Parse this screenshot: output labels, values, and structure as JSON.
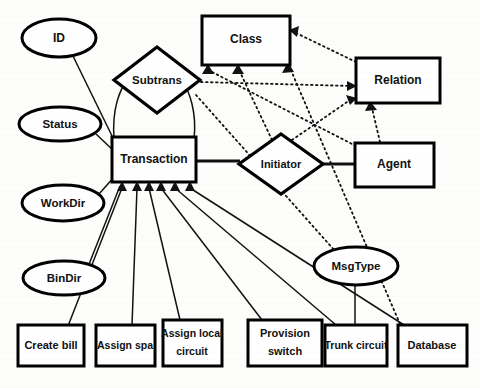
{
  "diagram": {
    "type": "entity-relationship",
    "stroke_color": "#111111",
    "fill_color": "#ffffff",
    "background_color": "#fdfdfb",
    "entities": [
      {
        "id": "transaction",
        "label": "Transaction",
        "shape": "rectangle",
        "x": 112,
        "y": 137,
        "w": 84,
        "h": 45
      },
      {
        "id": "class",
        "label": "Class",
        "shape": "rectangle",
        "x": 202,
        "y": 16,
        "w": 88,
        "h": 49
      },
      {
        "id": "relation",
        "label": "Relation",
        "shape": "rectangle",
        "x": 356,
        "y": 58,
        "w": 84,
        "h": 45
      },
      {
        "id": "agent",
        "label": "Agent",
        "shape": "rectangle",
        "x": 355,
        "y": 143,
        "w": 79,
        "h": 44
      },
      {
        "id": "create-bill",
        "label": "Create bill",
        "shape": "rectangle",
        "x": 18,
        "y": 325,
        "w": 66,
        "h": 41
      },
      {
        "id": "assign-spa",
        "label": "Assign spa",
        "shape": "rectangle",
        "x": 96,
        "y": 325,
        "w": 59,
        "h": 41
      },
      {
        "id": "assign-local-circuit",
        "label": "Assign local circuit",
        "line1": "Assign local",
        "line2": "circuit",
        "shape": "rectangle",
        "x": 163,
        "y": 320,
        "w": 59,
        "h": 46
      },
      {
        "id": "provision-switch",
        "label": "Provision switch",
        "line1": "Provision",
        "line2": "switch",
        "shape": "rectangle",
        "x": 248,
        "y": 320,
        "w": 74,
        "h": 46
      },
      {
        "id": "trunk-circuit",
        "label": "Trunk circuit",
        "shape": "rectangle",
        "x": 325,
        "y": 325,
        "w": 62,
        "h": 41
      },
      {
        "id": "database",
        "label": "Database",
        "shape": "rectangle",
        "x": 398,
        "y": 325,
        "w": 69,
        "h": 41
      }
    ],
    "relationships": [
      {
        "id": "subtrans",
        "label": "Subtrans",
        "shape": "diamond",
        "cx": 157,
        "cy": 80,
        "rx": 43,
        "ry": 33
      },
      {
        "id": "initiator",
        "label": "Initiator",
        "shape": "diamond",
        "cx": 281,
        "cy": 164,
        "rx": 42,
        "ry": 30
      }
    ],
    "attributes": [
      {
        "id": "id",
        "label": "ID",
        "shape": "ellipse",
        "cx": 59,
        "cy": 38,
        "rx": 37,
        "ry": 19
      },
      {
        "id": "status",
        "label": "Status",
        "shape": "ellipse",
        "cx": 60,
        "cy": 124,
        "rx": 41,
        "ry": 17
      },
      {
        "id": "workdir",
        "label": "WorkDir",
        "shape": "ellipse",
        "cx": 63,
        "cy": 203,
        "rx": 41,
        "ry": 18
      },
      {
        "id": "bindir",
        "label": "BinDir",
        "shape": "ellipse",
        "cx": 64,
        "cy": 278,
        "rx": 41,
        "ry": 17
      },
      {
        "id": "msgtype",
        "label": "MsgType",
        "shape": "ellipse",
        "cx": 356,
        "cy": 266,
        "rx": 42,
        "ry": 19
      }
    ],
    "connections": [
      {
        "id": "id-transaction",
        "from": "id",
        "to": "transaction",
        "style": "solid"
      },
      {
        "id": "status-transaction",
        "from": "status",
        "to": "transaction",
        "style": "solid"
      },
      {
        "id": "workdir-transaction",
        "from": "workdir",
        "to": "transaction",
        "style": "solid"
      },
      {
        "id": "bindir-transaction",
        "from": "bindir",
        "to": "transaction",
        "style": "solid"
      },
      {
        "id": "transaction-subtrans-left",
        "from": "transaction",
        "to": "subtrans",
        "style": "solid"
      },
      {
        "id": "transaction-subtrans-right",
        "from": "transaction",
        "to": "subtrans",
        "style": "solid"
      },
      {
        "id": "transaction-initiator",
        "from": "transaction",
        "to": "initiator",
        "style": "solid"
      },
      {
        "id": "initiator-agent",
        "from": "initiator",
        "to": "agent",
        "style": "solid"
      },
      {
        "id": "create-bill-transaction",
        "from": "create-bill",
        "to": "transaction",
        "style": "solid",
        "arrow": true
      },
      {
        "id": "assign-spa-transaction",
        "from": "assign-spa",
        "to": "transaction",
        "style": "solid",
        "arrow": true
      },
      {
        "id": "assign-local-circuit-transaction",
        "from": "assign-local-circuit",
        "to": "transaction",
        "style": "solid",
        "arrow": true
      },
      {
        "id": "provision-switch-transaction",
        "from": "provision-switch",
        "to": "transaction",
        "style": "solid",
        "arrow": true
      },
      {
        "id": "trunk-circuit-transaction",
        "from": "trunk-circuit",
        "to": "transaction",
        "style": "solid",
        "arrow": true
      },
      {
        "id": "database-transaction",
        "from": "database",
        "to": "transaction",
        "style": "solid",
        "arrow": true
      },
      {
        "id": "msgtype-trunk-circuit",
        "from": "msgtype",
        "to": "trunk-circuit",
        "style": "solid"
      },
      {
        "id": "subtrans-relation",
        "from": "subtrans",
        "to": "relation",
        "style": "dotted",
        "arrow": true
      },
      {
        "id": "subtrans-class",
        "from": "subtrans",
        "to": "class",
        "style": "dotted",
        "arrow": true
      },
      {
        "id": "relation-class",
        "from": "relation",
        "to": "class",
        "style": "dotted",
        "arrow": true
      },
      {
        "id": "initiator-class",
        "from": "initiator",
        "to": "class",
        "style": "dotted",
        "arrow": true
      },
      {
        "id": "initiator-relation",
        "from": "initiator",
        "to": "relation",
        "style": "dotted",
        "arrow": true
      },
      {
        "id": "agent-class",
        "from": "agent",
        "to": "class",
        "style": "dotted",
        "arrow": true
      },
      {
        "id": "agent-relation",
        "from": "agent",
        "to": "relation",
        "style": "dotted",
        "arrow": true
      },
      {
        "id": "database-class",
        "from": "database",
        "to": "class",
        "style": "dotted",
        "arrow": true
      }
    ]
  }
}
